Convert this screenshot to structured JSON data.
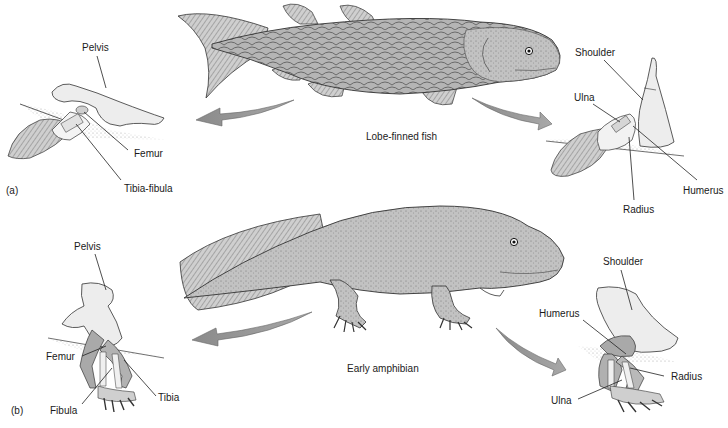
{
  "figure": {
    "panel_a": {
      "tag": "(a)",
      "organism": "Lobe-finned fish",
      "hindlimb_labels": {
        "pelvis": "Pelvis",
        "femur": "Femur",
        "tibia_fibula": "Tibia-fibula"
      },
      "forelimb_labels": {
        "shoulder": "Shoulder",
        "ulna": "Ulna",
        "humerus": "Humerus",
        "radius": "Radius"
      }
    },
    "panel_b": {
      "tag": "(b)",
      "organism": "Early amphibian",
      "hindlimb_labels": {
        "pelvis": "Pelvis",
        "femur": "Femur",
        "tibia": "Tibia",
        "fibula": "Fibula"
      },
      "forelimb_labels": {
        "shoulder": "Shoulder",
        "humerus": "Humerus",
        "radius": "Radius",
        "ulna": "Ulna"
      }
    },
    "colors": {
      "bone_light": "#ededed",
      "bone_dark": "#a9a9a9",
      "body_gray": "#b8b8b8",
      "arrow_gray": "#8c8c8c",
      "line": "#222222"
    }
  }
}
